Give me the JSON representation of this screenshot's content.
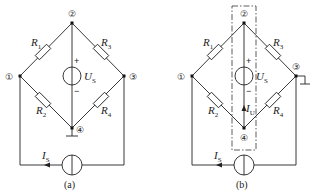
{
  "figures": [
    {
      "id": "a",
      "caption": "(a)",
      "nodes": [
        "①",
        "②",
        "③",
        "④"
      ],
      "resistors": [
        {
          "label": "R",
          "sub": "1",
          "between": [
            "①",
            "②"
          ]
        },
        {
          "label": "R",
          "sub": "2",
          "between": [
            "①",
            "④"
          ]
        },
        {
          "label": "R",
          "sub": "3",
          "between": [
            "②",
            "③"
          ]
        },
        {
          "label": "R",
          "sub": "4",
          "between": [
            "③",
            "④"
          ]
        }
      ],
      "voltage_source": {
        "label": "U",
        "sub": "S",
        "plus": "+",
        "minus": "−",
        "between": [
          "②",
          "④"
        ]
      },
      "current_source": {
        "label": "I",
        "sub": "S"
      },
      "ground_at": "④"
    },
    {
      "id": "b",
      "caption": "(b)",
      "nodes": [
        "①",
        "②",
        "③",
        "④"
      ],
      "resistors": [
        {
          "label": "R",
          "sub": "1",
          "between": [
            "①",
            "②"
          ]
        },
        {
          "label": "R",
          "sub": "2",
          "between": [
            "①",
            "④"
          ]
        },
        {
          "label": "R",
          "sub": "3",
          "between": [
            "②",
            "③"
          ]
        },
        {
          "label": "R",
          "sub": "4",
          "between": [
            "③",
            "④"
          ]
        }
      ],
      "voltage_source": {
        "label": "U",
        "sub": "S",
        "plus": "+",
        "minus": "−",
        "between": [
          "②",
          "④"
        ]
      },
      "current_source": {
        "label": "I",
        "sub": "S"
      },
      "branch_current": {
        "label": "I",
        "sub": "U"
      },
      "ground_at": "③",
      "dashed_box": "encloses voltage source branch between ② and ④"
    }
  ]
}
